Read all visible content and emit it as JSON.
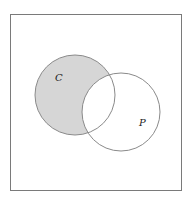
{
  "diagram": {
    "type": "venn",
    "universe_box": {
      "x": 10,
      "y": 14,
      "width": 171,
      "height": 176,
      "stroke": "#7a7a7a"
    },
    "sets": [
      {
        "id": "C",
        "label": "C",
        "cx": 75,
        "cy": 95,
        "r": 40,
        "label_x": 55,
        "label_y": 81
      },
      {
        "id": "P",
        "label": "P",
        "cx": 121,
        "cy": 112,
        "r": 39,
        "label_x": 139,
        "label_y": 126
      }
    ],
    "shaded_region": "C minus P",
    "colors": {
      "shade": "#d6d6d6",
      "stroke": "#8a8a8a",
      "background": "#ffffff"
    }
  }
}
